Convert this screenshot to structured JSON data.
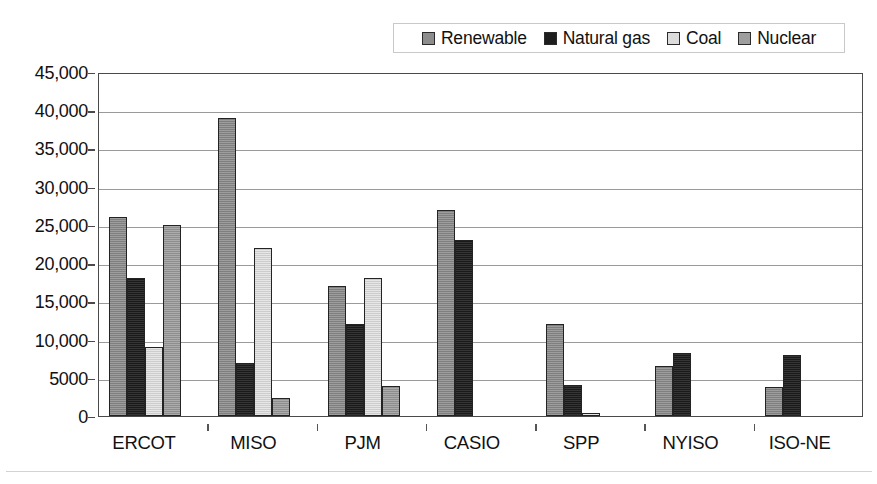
{
  "chart_data": {
    "type": "bar",
    "title": "",
    "subtitle": "",
    "xlabel": "",
    "ylabel": "",
    "categories": [
      "ERCOT",
      "MISO",
      "PJM",
      "CASIO",
      "SPP",
      "NYISO",
      "ISO-NE"
    ],
    "series": [
      {
        "name": "Renewable",
        "color": "#8d8d8d",
        "values": [
          26000,
          39000,
          17000,
          27000,
          12000,
          6500,
          3800
        ]
      },
      {
        "name": "Natural gas",
        "color": "#1e1e1e",
        "values": [
          18000,
          7000,
          12000,
          23000,
          4000,
          8200,
          8000
        ]
      },
      {
        "name": "Coal",
        "color": "#dcdcdc",
        "values": [
          9000,
          22000,
          18000,
          0,
          450,
          0,
          0
        ]
      },
      {
        "name": "Nuclear",
        "color": "#9e9e9e",
        "values": [
          25000,
          2400,
          3900,
          0,
          0,
          0,
          0
        ]
      }
    ],
    "ylim": [
      0,
      45000
    ],
    "ytick_values": [
      0,
      5000,
      10000,
      15000,
      20000,
      25000,
      30000,
      35000,
      40000,
      45000
    ],
    "ytick_labels": [
      "0",
      "5000",
      "10,000",
      "15,000",
      "20,000",
      "25,000",
      "30,000",
      "35,000",
      "40,000",
      "45,000"
    ],
    "grid": "horizontal",
    "legend_position": "top-right",
    "legend_entries": [
      "Renewable",
      "Natural gas",
      "Coal",
      "Nuclear"
    ]
  }
}
